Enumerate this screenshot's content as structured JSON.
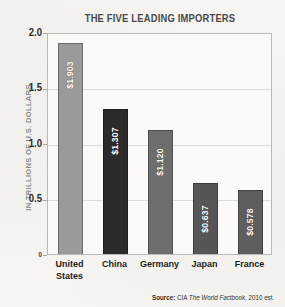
{
  "chart_data": {
    "type": "bar",
    "title": "THE FIVE LEADING IMPORTERS",
    "xlabel": "",
    "ylabel": "IN TRILLIONS OF U.S. DOLLARS",
    "ylim": [
      0,
      2.0
    ],
    "grid": true,
    "legend": "none",
    "categories": [
      "United States",
      "China",
      "Germany",
      "Japan",
      "France"
    ],
    "category_lines": [
      [
        "United",
        "States"
      ],
      [
        "China"
      ],
      [
        "Germany"
      ],
      [
        "Japan"
      ],
      [
        "France"
      ]
    ],
    "values": [
      1.903,
      1.307,
      1.12,
      0.637,
      0.578
    ],
    "value_labels": [
      "$1.903",
      "$1.307",
      "$1.120",
      "$0.637",
      "$0.578"
    ],
    "bar_colors": [
      "#9a9a9a",
      "#2b2b2b",
      "#6e6e6e",
      "#565656",
      "#5e5e5e"
    ],
    "y_ticks": [
      "2.0",
      "1.5",
      "1.0",
      "0.5",
      "0"
    ],
    "y_tick_values": [
      2.0,
      1.5,
      1.0,
      0.5,
      0
    ]
  },
  "source": {
    "label": "Source:",
    "agency": "CIA",
    "work": "The World Factbook",
    "note": ", 2010 est."
  }
}
